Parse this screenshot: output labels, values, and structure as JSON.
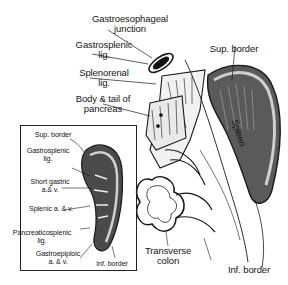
{
  "figure": {
    "main_view": {
      "labels": {
        "gastroesophageal_junction_1": "Gastroesophageal",
        "gastroesophageal_junction_2": "junction",
        "gastrosplenic_lig_1": "Gastrosplenic",
        "gastrosplenic_lig_2": "lig.",
        "splenorenal_lig_1": "Splenorenal",
        "splenorenal_lig_2": "lig.",
        "body_tail_pancreas_1": "Body & tail of",
        "body_tail_pancreas_2": "pancreas",
        "sup_border": "Sup. border",
        "spleen": "Spleen",
        "transverse_colon_1": "Transverse",
        "transverse_colon_2": "colon",
        "inf_border": "Inf. border"
      }
    },
    "inset_view": {
      "labels": {
        "sup_border": "Sup. border",
        "gastrosplenic_lig_1": "Gastrosplenic",
        "gastrosplenic_lig_2": "lig.",
        "short_gastric_1": "Short gastric",
        "short_gastric_2": "a.& v.",
        "splenic_av": "Splenic a. & v.",
        "pancreaticosplenic_lig_1": "Pancreaticosplenic",
        "pancreaticosplenic_lig_2": "lig.",
        "gastroepiploic_1": "Gastroepiploic",
        "gastroepiploic_2": "a. & v.",
        "inf_border": "Inf. border"
      }
    }
  }
}
